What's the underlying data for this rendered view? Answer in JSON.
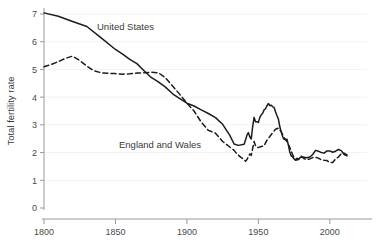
{
  "chart_data": {
    "type": "line",
    "title": "",
    "xlabel": "",
    "ylabel": "Total fertility rate",
    "xlim": [
      1800,
      2012
    ],
    "ylim": [
      0,
      7.4
    ],
    "grid": true,
    "legend_position": "inline-annotations",
    "xticks": [
      1800,
      1850,
      1900,
      1950,
      2000
    ],
    "xtick_labels": [
      "1800",
      "1850",
      "1900",
      "1950",
      "2000"
    ],
    "yticks": [
      0,
      1,
      2,
      3,
      4,
      5,
      6,
      7
    ],
    "ytick_labels": [
      "0",
      "1",
      "2",
      "3",
      "4",
      "5",
      "6",
      "7"
    ],
    "colors": {
      "line": "#1c1c1c",
      "axis": "#9a9a9a",
      "text": "#3a3a3a",
      "background": "#ffffff"
    },
    "series": [
      {
        "name": "United States",
        "style": "solid",
        "label_text": "United States",
        "x": [
          1800,
          1810,
          1820,
          1830,
          1840,
          1850,
          1855,
          1860,
          1865,
          1870,
          1875,
          1880,
          1885,
          1890,
          1895,
          1900,
          1905,
          1910,
          1915,
          1920,
          1925,
          1930,
          1933,
          1936,
          1940,
          1941,
          1942,
          1943,
          1944,
          1945,
          1946,
          1947,
          1948,
          1949,
          1950,
          1951,
          1952,
          1953,
          1954,
          1955,
          1956,
          1957,
          1958,
          1959,
          1960,
          1961,
          1962,
          1963,
          1964,
          1965,
          1966,
          1967,
          1968,
          1969,
          1970,
          1971,
          1972,
          1973,
          1974,
          1975,
          1976,
          1977,
          1978,
          1979,
          1980,
          1982,
          1984,
          1986,
          1988,
          1990,
          1992,
          1994,
          1996,
          1998,
          2000,
          2002,
          2004,
          2006,
          2008,
          2010,
          2012
        ],
        "y": [
          7.04,
          6.92,
          6.73,
          6.55,
          6.14,
          5.72,
          5.55,
          5.36,
          5.21,
          4.95,
          4.71,
          4.55,
          4.36,
          4.12,
          3.95,
          3.78,
          3.68,
          3.54,
          3.41,
          3.26,
          3.02,
          2.62,
          2.31,
          2.26,
          2.3,
          2.45,
          2.63,
          2.72,
          2.57,
          2.49,
          2.94,
          3.27,
          3.11,
          3.11,
          3.09,
          3.27,
          3.36,
          3.42,
          3.54,
          3.58,
          3.69,
          3.77,
          3.7,
          3.71,
          3.65,
          3.63,
          3.47,
          3.33,
          3.21,
          2.93,
          2.74,
          2.57,
          2.48,
          2.46,
          2.48,
          2.27,
          2.01,
          1.88,
          1.84,
          1.77,
          1.74,
          1.79,
          1.76,
          1.81,
          1.84,
          1.83,
          1.81,
          1.84,
          1.93,
          2.08,
          2.05,
          2.0,
          1.98,
          2.06,
          2.06,
          2.01,
          2.05,
          2.11,
          2.07,
          1.93,
          1.88
        ]
      },
      {
        "name": "England and Wales",
        "style": "dashed",
        "label_text": "England and Wales",
        "x": [
          1800,
          1805,
          1810,
          1815,
          1820,
          1825,
          1830,
          1835,
          1840,
          1845,
          1850,
          1855,
          1860,
          1865,
          1870,
          1875,
          1880,
          1885,
          1890,
          1895,
          1900,
          1905,
          1910,
          1915,
          1920,
          1925,
          1930,
          1933,
          1935,
          1938,
          1940,
          1941,
          1942,
          1943,
          1944,
          1945,
          1946,
          1947,
          1948,
          1949,
          1950,
          1952,
          1954,
          1956,
          1958,
          1960,
          1962,
          1964,
          1966,
          1968,
          1970,
          1972,
          1974,
          1976,
          1978,
          1980,
          1982,
          1984,
          1986,
          1988,
          1990,
          1992,
          1994,
          1996,
          1998,
          2000,
          2002,
          2004,
          2006,
          2008,
          2010,
          2012
        ],
        "y": [
          5.1,
          5.18,
          5.28,
          5.4,
          5.48,
          5.32,
          5.12,
          4.95,
          4.88,
          4.86,
          4.85,
          4.83,
          4.84,
          4.87,
          4.88,
          4.9,
          4.88,
          4.7,
          4.4,
          4.1,
          3.78,
          3.5,
          3.1,
          2.8,
          2.7,
          2.4,
          2.2,
          2.08,
          1.95,
          1.82,
          1.75,
          1.69,
          1.75,
          1.85,
          1.95,
          1.9,
          2.15,
          2.4,
          2.25,
          2.2,
          2.18,
          2.22,
          2.24,
          2.45,
          2.58,
          2.72,
          2.84,
          2.88,
          2.75,
          2.54,
          2.4,
          2.18,
          1.92,
          1.72,
          1.75,
          1.87,
          1.78,
          1.75,
          1.77,
          1.82,
          1.83,
          1.8,
          1.74,
          1.72,
          1.71,
          1.64,
          1.64,
          1.77,
          1.84,
          1.96,
          1.98,
          1.92
        ]
      }
    ],
    "annotations": [
      {
        "text": "United States",
        "x_px": 97,
        "y_px": 30
      },
      {
        "text": "England and Wales",
        "x_px": 119,
        "y_px": 148
      }
    ]
  }
}
